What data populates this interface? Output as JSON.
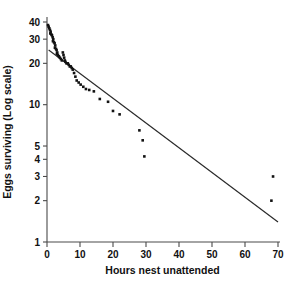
{
  "chart_data": {
    "type": "scatter",
    "title": "",
    "xlabel": "Hours nest unattended",
    "ylabel": "Eggs surviving (Log scale)",
    "yscale": "log",
    "xscale": "linear",
    "xlim": [
      0,
      70
    ],
    "ylim": [
      1,
      40
    ],
    "grid": false,
    "legend": null,
    "xticks": [
      0,
      10,
      20,
      30,
      40,
      50,
      60,
      70
    ],
    "xticklabels": [
      "0",
      "10",
      "20",
      "30",
      "40",
      "50",
      "60",
      "70"
    ],
    "yticks": [
      1,
      2,
      3,
      4,
      5,
      10,
      20,
      30,
      40
    ],
    "yticklabels": [
      "1",
      "2",
      "3",
      "4",
      "5",
      "10",
      "20",
      "30",
      "40"
    ],
    "series": [
      {
        "name": "Eggs surviving",
        "marker": "square-dot",
        "color": "#121212",
        "points": [
          [
            0.3,
            38.0
          ],
          [
            0.5,
            37.0
          ],
          [
            0.7,
            36.0
          ],
          [
            0.9,
            35.0
          ],
          [
            1.1,
            34.0
          ],
          [
            1.0,
            33.0
          ],
          [
            1.3,
            32.5
          ],
          [
            1.5,
            32.0
          ],
          [
            1.7,
            31.0
          ],
          [
            1.9,
            30.0
          ],
          [
            1.8,
            29.0
          ],
          [
            2.1,
            28.5
          ],
          [
            2.3,
            28.0
          ],
          [
            2.5,
            27.0
          ],
          [
            2.4,
            26.0
          ],
          [
            2.7,
            25.5
          ],
          [
            2.9,
            25.0
          ],
          [
            3.1,
            24.0
          ],
          [
            3.0,
            23.5
          ],
          [
            3.3,
            23.0
          ],
          [
            3.6,
            22.5
          ],
          [
            3.9,
            22.0
          ],
          [
            4.2,
            21.5
          ],
          [
            4.5,
            21.0
          ],
          [
            4.8,
            24.0
          ],
          [
            5.0,
            23.0
          ],
          [
            5.2,
            22.0
          ],
          [
            5.4,
            21.0
          ],
          [
            5.6,
            20.5
          ],
          [
            5.9,
            20.0
          ],
          [
            6.3,
            20.0
          ],
          [
            6.6,
            19.5
          ],
          [
            6.9,
            19.0
          ],
          [
            7.2,
            19.0
          ],
          [
            7.5,
            18.5
          ],
          [
            7.8,
            18.0
          ],
          [
            8.2,
            17.0
          ],
          [
            8.6,
            16.0
          ],
          [
            9.0,
            15.0
          ],
          [
            9.6,
            14.5
          ],
          [
            10.2,
            14.0
          ],
          [
            11.0,
            13.5
          ],
          [
            11.8,
            13.0
          ],
          [
            12.8,
            12.8
          ],
          [
            14.2,
            12.5
          ],
          [
            16.0,
            11.0
          ],
          [
            18.5,
            10.5
          ],
          [
            20.0,
            9.0
          ],
          [
            22.0,
            8.5
          ],
          [
            28.0,
            6.5
          ],
          [
            29.0,
            5.5
          ],
          [
            29.5,
            4.2
          ],
          [
            68.5,
            3.0
          ],
          [
            68.0,
            2.0
          ]
        ]
      }
    ],
    "fit_line": {
      "name": "regression line",
      "color": "#2b2b2b",
      "x_start": 0.5,
      "y_start": 25.0,
      "x_end": 70.0,
      "y_end": 1.4
    }
  }
}
